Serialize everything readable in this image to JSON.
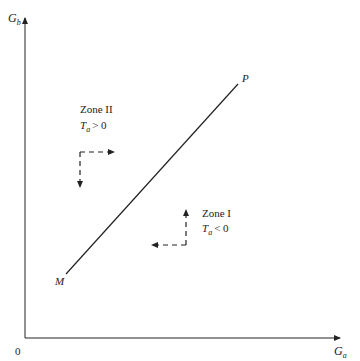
{
  "diagram": {
    "axes": {
      "origin_label": "0",
      "x_label": "G",
      "x_label_sub": "a",
      "y_label": "G",
      "y_label_sub": "b"
    },
    "line": {
      "start_label": "M",
      "end_label": "P"
    },
    "zones": [
      {
        "name": "Zone II",
        "condition_var": "T",
        "condition_sub": "a",
        "condition_rel": "> 0",
        "arrows": [
          "right",
          "down"
        ]
      },
      {
        "name": "Zone I",
        "condition_var": "T",
        "condition_sub": "a",
        "condition_rel": "< 0",
        "arrows": [
          "up",
          "left"
        ]
      }
    ],
    "colors": {
      "stroke": "#222222",
      "background": "#ffffff"
    }
  }
}
